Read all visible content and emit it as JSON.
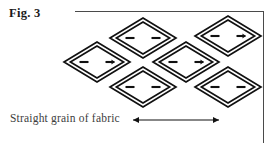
{
  "figure": {
    "label": "Fig. 3",
    "caption": "Straight grain of fabric",
    "line_color": "#111111",
    "rule_color": "#4a4a4a",
    "caption_color": "#3d3d3d",
    "background": "#ffffff"
  },
  "arrow": {
    "name": "grain-direction-arrow",
    "x1": 133,
    "x2": 219,
    "y": 120,
    "double_headed": true
  },
  "diagram": {
    "type": "tessellated-diamond-layout",
    "shape": "diamond",
    "count": 6,
    "outer_half_width": 33,
    "outer_half_height": 20,
    "inner_inset": 4,
    "dash_length": 9,
    "dash_offset": 13,
    "diamonds": [
      {
        "name": "diamond-top-left",
        "cx": 143,
        "cy": 38,
        "right_dash_arrow": false
      },
      {
        "name": "diamond-top-right",
        "cx": 228,
        "cy": 36,
        "right_dash_arrow": true
      },
      {
        "name": "diamond-middle-left",
        "cx": 97,
        "cy": 62,
        "right_dash_arrow": true
      },
      {
        "name": "diamond-middle-right",
        "cx": 186,
        "cy": 62,
        "right_dash_arrow": true
      },
      {
        "name": "diamond-bottom-left",
        "cx": 143,
        "cy": 87,
        "right_dash_arrow": false
      },
      {
        "name": "diamond-bottom-right",
        "cx": 228,
        "cy": 87,
        "right_dash_arrow": false
      }
    ]
  }
}
